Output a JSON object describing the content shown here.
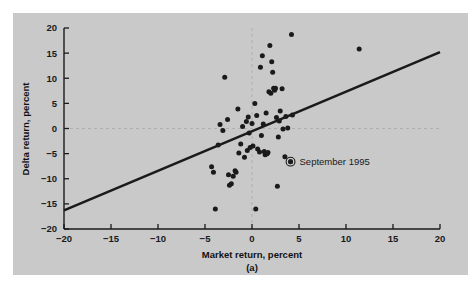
{
  "figure": {
    "caption": "(a)",
    "panel_color": "#c9c9c9",
    "page_color": "#ffffff",
    "ink_color": "#1a1a1a"
  },
  "annotation": {
    "label": "September 1995",
    "marker_x": 4.1,
    "marker_y": -6.6,
    "marker_type": "circled-dot"
  },
  "chart_data": {
    "type": "scatter",
    "title": "",
    "xlabel": "Market return, percent",
    "ylabel": "Delta return, percent",
    "xlim": [
      -20,
      20
    ],
    "ylim": [
      -20,
      20
    ],
    "xticks": [
      -20,
      -15,
      -10,
      -5,
      0,
      5,
      10,
      15,
      20
    ],
    "yticks": [
      -20,
      -15,
      -10,
      -5,
      0,
      5,
      10,
      15,
      20
    ],
    "xticklabels": [
      "-20",
      "-15",
      "-10",
      "-5",
      "0",
      "5",
      "10",
      "15",
      "20"
    ],
    "yticklabels": [
      "-20",
      "-15",
      "-10",
      "-5",
      "0",
      "5",
      "10",
      "15",
      "20"
    ],
    "grid": false,
    "reference_lines": [
      {
        "name": "zero-horizontal",
        "orientation": "horizontal",
        "value": 0,
        "style": "dashed"
      },
      {
        "name": "zero-vertical",
        "orientation": "vertical",
        "value": 0,
        "style": "dashed"
      }
    ],
    "legend": null,
    "series": [
      {
        "name": "Delta vs Market monthly returns",
        "marker": "filled-circle",
        "color": "#1a1a1a",
        "points": [
          [
            -4.3,
            -7.6
          ],
          [
            -4.1,
            -8.7
          ],
          [
            -3.9,
            -16.0
          ],
          [
            -3.6,
            -3.3
          ],
          [
            -3.4,
            0.8
          ],
          [
            -3.1,
            -0.4
          ],
          [
            -2.9,
            10.2
          ],
          [
            -2.6,
            1.8
          ],
          [
            -2.5,
            -9.2
          ],
          [
            -2.4,
            -11.3
          ],
          [
            -2.2,
            -11.0
          ],
          [
            -2.0,
            -9.5
          ],
          [
            -1.8,
            -8.4
          ],
          [
            -1.7,
            -8.7
          ],
          [
            -1.5,
            3.9
          ],
          [
            -1.4,
            -4.9
          ],
          [
            -1.2,
            -3.1
          ],
          [
            -1.0,
            0.4
          ],
          [
            -0.8,
            -5.7
          ],
          [
            -0.6,
            1.4
          ],
          [
            -0.5,
            -4.4
          ],
          [
            -0.4,
            2.3
          ],
          [
            -0.3,
            -0.9
          ],
          [
            -0.2,
            -3.8
          ],
          [
            0.0,
            1.0
          ],
          [
            0.1,
            -3.5
          ],
          [
            0.3,
            5.0
          ],
          [
            0.4,
            -16.0
          ],
          [
            0.5,
            2.6
          ],
          [
            0.6,
            -4.1
          ],
          [
            0.8,
            -4.7
          ],
          [
            0.9,
            12.2
          ],
          [
            1.0,
            -1.4
          ],
          [
            1.1,
            14.5
          ],
          [
            1.2,
            0.9
          ],
          [
            1.3,
            -4.6
          ],
          [
            1.4,
            -5.2
          ],
          [
            1.5,
            3.1
          ],
          [
            1.6,
            -5.0
          ],
          [
            1.7,
            -4.8
          ],
          [
            1.8,
            7.3
          ],
          [
            1.9,
            16.5
          ],
          [
            2.0,
            7.0
          ],
          [
            2.1,
            13.3
          ],
          [
            2.2,
            11.2
          ],
          [
            2.3,
            8.0
          ],
          [
            2.4,
            7.6
          ],
          [
            2.5,
            8.0
          ],
          [
            2.6,
            2.2
          ],
          [
            2.7,
            -11.5
          ],
          [
            2.8,
            -1.7
          ],
          [
            2.9,
            1.5
          ],
          [
            3.0,
            3.5
          ],
          [
            3.2,
            7.9
          ],
          [
            3.3,
            -0.1
          ],
          [
            3.5,
            -5.6
          ],
          [
            3.6,
            2.4
          ],
          [
            3.8,
            0.1
          ],
          [
            4.1,
            -6.6
          ],
          [
            4.2,
            18.7
          ],
          [
            4.3,
            2.7
          ],
          [
            11.4,
            15.8
          ]
        ]
      }
    ],
    "fit_line": {
      "name": "regression-line",
      "x_start": -20,
      "y_start": -16.3,
      "x_end": 20,
      "y_end": 15.2,
      "slope": 0.7875,
      "intercept": -0.55,
      "color": "#1a1a1a",
      "width": 2.6
    }
  }
}
